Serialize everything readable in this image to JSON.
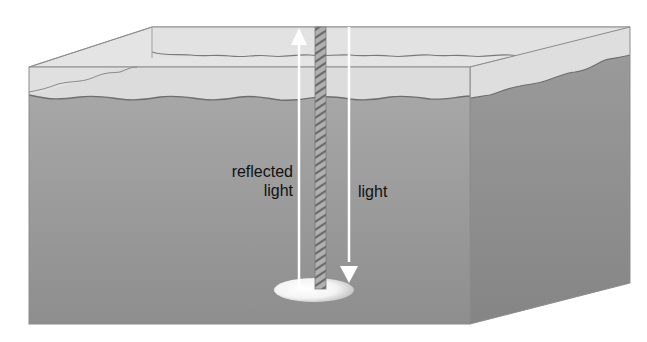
{
  "diagram": {
    "title": "",
    "labels": {
      "reflected_light_line1": "reflected",
      "reflected_light_line2": "light",
      "incident_light": "light"
    },
    "elements": [
      {
        "id": "water-block",
        "kind": "3d-box"
      },
      {
        "id": "water-surface",
        "kind": "wavy-line"
      },
      {
        "id": "rope",
        "kind": "twisted-rope"
      },
      {
        "id": "disk",
        "kind": "white-ellipse"
      },
      {
        "id": "incident-light-arrow",
        "kind": "arrow",
        "direction": "down"
      },
      {
        "id": "reflected-light-arrow",
        "kind": "arrow",
        "direction": "up"
      }
    ],
    "colors": {
      "air": "#dcdcdc",
      "air_top": "#e6e6e6",
      "water_front_top": "#a9a9a9",
      "water_front_bottom": "#8d8d8d",
      "water_side": "#8a8a8a",
      "edge": "#8c8c8c",
      "surface_line": "#6e6e6e",
      "arrow": "#ffffff",
      "rope": "#9a9a9a",
      "text": "#111111"
    }
  }
}
